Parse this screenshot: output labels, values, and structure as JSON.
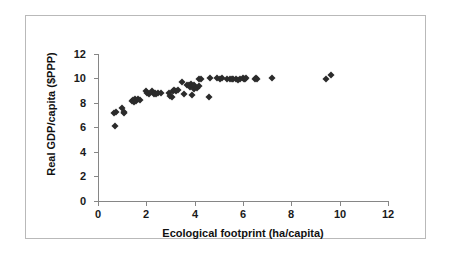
{
  "chart_data": {
    "type": "scatter",
    "title": "",
    "xlabel": "Ecological footprint (ha/capita)",
    "ylabel": "Real GDP/capita ($PPP)",
    "xlim": [
      0,
      12
    ],
    "ylim": [
      0,
      12
    ],
    "xticks": [
      0,
      2,
      4,
      6,
      8,
      10,
      12
    ],
    "yticks": [
      0,
      2,
      4,
      6,
      8,
      10,
      12
    ],
    "xtick_labels": [
      "0",
      "2",
      "4",
      "6",
      "8",
      "10",
      "12"
    ],
    "ytick_labels": [
      "0",
      "2",
      "4",
      "6",
      "8",
      "10",
      "12"
    ],
    "grid": false,
    "legend": false,
    "marker": "diamond",
    "marker_color": "#2b2b2b",
    "series": [
      {
        "name": "Countries",
        "points": [
          [
            0.62,
            7.2
          ],
          [
            0.68,
            6.15
          ],
          [
            0.72,
            7.25
          ],
          [
            0.95,
            7.6
          ],
          [
            1.02,
            7.2
          ],
          [
            1.05,
            7.3
          ],
          [
            1.35,
            8.2
          ],
          [
            1.4,
            8.25
          ],
          [
            1.45,
            8.1
          ],
          [
            1.5,
            8.3
          ],
          [
            1.55,
            8.2
          ],
          [
            1.62,
            8.3
          ],
          [
            1.68,
            8.25
          ],
          [
            1.95,
            8.95
          ],
          [
            2.0,
            8.8
          ],
          [
            2.08,
            8.75
          ],
          [
            2.2,
            9.0
          ],
          [
            2.28,
            8.75
          ],
          [
            2.32,
            8.8
          ],
          [
            2.35,
            8.7
          ],
          [
            2.45,
            8.85
          ],
          [
            2.55,
            8.8
          ],
          [
            2.9,
            8.8
          ],
          [
            2.95,
            8.55
          ],
          [
            3.0,
            8.5
          ],
          [
            3.05,
            9.0
          ],
          [
            3.12,
            9.1
          ],
          [
            3.18,
            8.95
          ],
          [
            3.25,
            9.05
          ],
          [
            3.45,
            9.75
          ],
          [
            3.5,
            8.7
          ],
          [
            3.65,
            9.5
          ],
          [
            3.72,
            9.45
          ],
          [
            3.78,
            9.3
          ],
          [
            3.8,
            9.55
          ],
          [
            3.85,
            8.65
          ],
          [
            3.88,
            9.4
          ],
          [
            3.92,
            9.15
          ],
          [
            3.95,
            9.5
          ],
          [
            4.05,
            9.2
          ],
          [
            4.12,
            9.4
          ],
          [
            4.15,
            10.0
          ],
          [
            4.2,
            9.95
          ],
          [
            4.55,
            8.45
          ],
          [
            4.6,
            10.05
          ],
          [
            4.9,
            10.05
          ],
          [
            5.0,
            10.0
          ],
          [
            5.1,
            10.05
          ],
          [
            5.3,
            9.95
          ],
          [
            5.4,
            10.0
          ],
          [
            5.5,
            10.0
          ],
          [
            5.55,
            9.95
          ],
          [
            5.65,
            10.0
          ],
          [
            5.75,
            9.9
          ],
          [
            5.85,
            10.0
          ],
          [
            5.95,
            10.05
          ],
          [
            6.0,
            9.95
          ],
          [
            6.05,
            10.0
          ],
          [
            6.1,
            10.05
          ],
          [
            6.45,
            10.0
          ],
          [
            6.5,
            10.05
          ],
          [
            6.55,
            9.95
          ],
          [
            7.15,
            10.05
          ],
          [
            9.4,
            10.0
          ],
          [
            9.6,
            10.25
          ]
        ]
      }
    ]
  },
  "axes": {
    "y_title": "Real GDP/capita ($PPP)",
    "x_title": "Ecological footprint (ha/capita)"
  }
}
